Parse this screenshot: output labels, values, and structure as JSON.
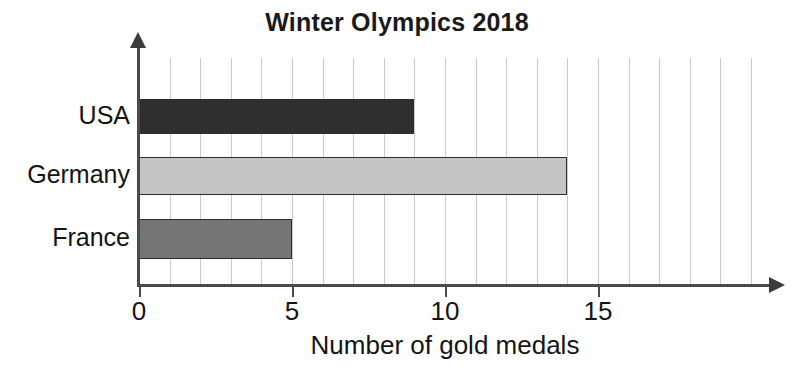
{
  "chart_data": {
    "type": "bar",
    "orientation": "horizontal",
    "title": "Winter Olympics 2018",
    "xlabel": "Number of gold medals",
    "ylabel": "",
    "categories": [
      "USA",
      "Germany",
      "France"
    ],
    "values": [
      9,
      14,
      5
    ],
    "series": [
      {
        "name": "Gold medals",
        "values": [
          9,
          14,
          5
        ]
      }
    ],
    "xlim": [
      0,
      20
    ],
    "ylim": [
      0,
      3
    ],
    "xticks": [
      0,
      5,
      10,
      15
    ],
    "xtick_labels": [
      "0",
      "5",
      "10",
      "15"
    ],
    "grid": true,
    "grid_axis": "x",
    "grid_minor_step": 1,
    "legend": false,
    "legend_position": "none",
    "bar_colors": [
      "#2f2f2f",
      "#c4c4c4",
      "#757575"
    ],
    "bar_border_color": "#2e2e2e",
    "grid_color": "#c9c9ce",
    "axis_color": "#4a4a4a",
    "background_color": "#ffffff",
    "text_color": "#151515",
    "bars": [
      {
        "label": "USA",
        "value": 9,
        "color": "#2f2f2f"
      },
      {
        "label": "Germany",
        "value": 14,
        "color": "#c4c4c4"
      },
      {
        "label": "France",
        "value": 5,
        "color": "#757575"
      }
    ]
  }
}
